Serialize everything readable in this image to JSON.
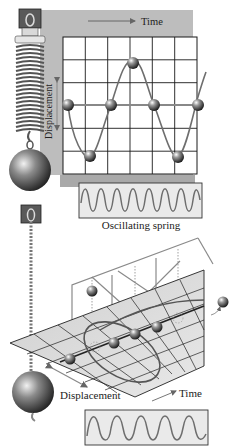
{
  "top_panel": {
    "time_label": "Time",
    "displacement_label": "Displacement",
    "caption": "Oscillating spring",
    "grid": {
      "columns": 6,
      "rows": 6
    },
    "trace_cycles": 8
  },
  "bottom_panel": {
    "displacement_label": "Displacement",
    "time_label": "Time",
    "trace_cycles": 5.5
  },
  "colors": {
    "panel_gray": "#bdbdbd",
    "grid_line": "#1a1a1a",
    "curve": "#6e6e6e",
    "sphere_dark": "#2a2a2a",
    "sphere_light": "#f0f0f0"
  }
}
